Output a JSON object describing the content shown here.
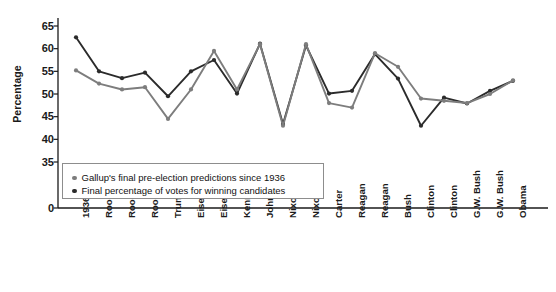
{
  "chart_data": {
    "type": "line",
    "title": "",
    "xlabel": "",
    "ylabel": "Percentage",
    "ylim": [
      0,
      67
    ],
    "y_axis_break": true,
    "y_ticks": [
      0,
      35,
      40,
      45,
      50,
      55,
      60,
      65
    ],
    "grid": false,
    "legend_position": "inside-lower-left",
    "categories": [
      "1936",
      "Roosevelt",
      "Roosevelt",
      "Roosevelt",
      "Truman",
      "Eisenhower",
      "Eisenhower",
      "Kennedy",
      "Johnson",
      "Nixon",
      "Nixon",
      "Carter",
      "Reagan",
      "Reagan",
      "Bush",
      "Clinton",
      "Clinton",
      "G.W. Bush",
      "G.W. Bush",
      "Obama"
    ],
    "series": [
      {
        "name": "Gallup's final pre-election predictions since 1936",
        "color": "#7d7d7d",
        "values": [
          55.2,
          52.3,
          51.0,
          51.5,
          44.5,
          51.0,
          59.5,
          51.0,
          61.0,
          43.0,
          61.0,
          48.0,
          47.0,
          59.0,
          56.0,
          49.0,
          48.5,
          48.0,
          50.0,
          53.0
        ]
      },
      {
        "name": "Final percentage of votes for winning candidates",
        "color": "#2b2b2b",
        "values": [
          62.5,
          55.0,
          53.5,
          54.7,
          49.5,
          55.0,
          57.5,
          50.1,
          61.1,
          43.4,
          60.7,
          50.1,
          50.7,
          58.8,
          53.4,
          43.0,
          49.2,
          47.9,
          50.7,
          52.9
        ]
      }
    ]
  },
  "legend": {
    "items": [
      {
        "label": "Gallup's final pre-election predictions since 1936",
        "color": "#7d7d7d"
      },
      {
        "label": "Final percentage of votes for winning candidates",
        "color": "#2b2b2b"
      }
    ]
  }
}
